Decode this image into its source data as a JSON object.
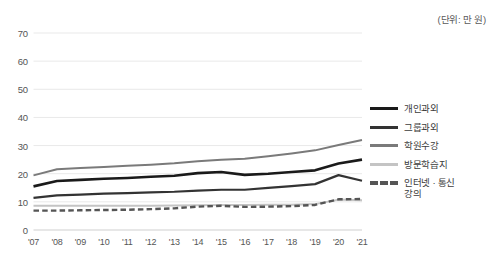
{
  "unit_note": "(단위: 만 원)",
  "legend": {
    "position": "right",
    "items": [
      {
        "label": "개인과외",
        "color": "#1a1a1a",
        "style": "solid",
        "width": 2.6
      },
      {
        "label": "그룹과외",
        "color": "#333333",
        "style": "solid",
        "width": 2.2
      },
      {
        "label": "학원수강",
        "color": "#7a7a7a",
        "style": "solid",
        "width": 2.0
      },
      {
        "label": "방문학습지",
        "color": "#c4c4c4",
        "style": "solid",
        "width": 2.0
      },
      {
        "label": "인터넷 · 통신\n강의",
        "color": "#555555",
        "style": "dashed",
        "width": 2.4
      }
    ]
  },
  "chart_data": {
    "type": "line",
    "title": "",
    "subtitle": "",
    "xlabel": "",
    "ylabel": "",
    "unit": "만 원",
    "grid": true,
    "legend_position": "right",
    "ylim": [
      0,
      70
    ],
    "yticks": [
      0,
      10,
      20,
      30,
      40,
      50,
      60,
      70
    ],
    "ytick_labels": [
      "0",
      "10",
      "20",
      "30",
      "40",
      "50",
      "60",
      "70"
    ],
    "categories": [
      "'07",
      "'08",
      "'09",
      "'10",
      "'11",
      "'12",
      "'13",
      "'14",
      "'15",
      "'16",
      "'17",
      "'18",
      "'19",
      "'20",
      "'21"
    ],
    "series": [
      {
        "name": "개인과외",
        "color": "#1a1a1a",
        "style": "solid",
        "width": 2.6,
        "values": [
          15.5,
          17.4,
          17.8,
          18.2,
          18.5,
          18.9,
          19.3,
          20.2,
          20.6,
          19.6,
          20.0,
          20.6,
          21.2,
          23.6,
          25.0
        ]
      },
      {
        "name": "그룹과외",
        "color": "#333333",
        "style": "solid",
        "width": 2.2,
        "values": [
          11.4,
          12.3,
          12.6,
          12.9,
          13.1,
          13.4,
          13.6,
          14.0,
          14.3,
          14.3,
          15.0,
          15.6,
          16.3,
          19.5,
          17.5
        ]
      },
      {
        "name": "학원수강",
        "color": "#7a7a7a",
        "style": "solid",
        "width": 2.0,
        "values": [
          19.4,
          21.6,
          22.0,
          22.4,
          22.8,
          23.2,
          23.7,
          24.4,
          25.0,
          25.3,
          26.2,
          27.2,
          28.3,
          30.2,
          32.0
        ]
      },
      {
        "name": "방문학습지",
        "color": "#c4c4c4",
        "style": "solid",
        "width": 2.0,
        "values": [
          8.6,
          8.6,
          8.6,
          8.6,
          8.6,
          8.6,
          8.7,
          8.8,
          8.9,
          8.9,
          9.0,
          9.0,
          9.2,
          10.8,
          10.6
        ]
      },
      {
        "name": "인터넷 · 통신 강의",
        "color": "#555555",
        "style": "dashed",
        "width": 2.4,
        "values": [
          6.9,
          6.9,
          7.0,
          7.1,
          7.2,
          7.4,
          7.7,
          8.3,
          8.6,
          8.2,
          8.3,
          8.5,
          8.9,
          10.9,
          11.0
        ]
      }
    ]
  }
}
